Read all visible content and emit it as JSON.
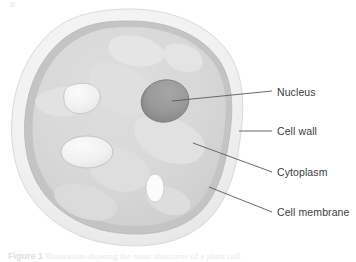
{
  "figure": {
    "caption_label": "Figure 1",
    "caption_text": "Illustration showing the main structures of a plant cell.",
    "background_color": "#ffffff"
  },
  "labels": [
    {
      "id": "nucleus",
      "text": "Nucleus"
    },
    {
      "id": "cell-wall",
      "text": "Cell wall"
    },
    {
      "id": "cytoplasm",
      "text": "Cytoplasm"
    },
    {
      "id": "cell-membrane",
      "text": "Cell membrane"
    }
  ],
  "colors": {
    "cell_wall": "#f1f1f1",
    "cell_wall_edge": "#dcdcdc",
    "cell_membrane": "#c6c6c6",
    "cytoplasm": "#d7d7d7",
    "cytoplasm_light": "#e4e4e4",
    "cytoplasm_lighter": "#ececec",
    "nucleus": "#9a9a9a",
    "nucleus_dark": "#8a8a8a",
    "nucleus_edge": "#7e7e7e",
    "vacuole": "#f0f0f0",
    "vacuole_edge": "#c4c4c4",
    "leader_line": "#5a5a5a",
    "label_text": "#3c3c3c"
  },
  "structures": [
    {
      "name": "cell-wall",
      "shape": "outer-ring"
    },
    {
      "name": "cell-membrane",
      "shape": "inner-ring"
    },
    {
      "name": "cytoplasm",
      "shape": "interior-fill"
    },
    {
      "name": "nucleus",
      "shape": "ellipse"
    },
    {
      "name": "vacuole-upper-left",
      "shape": "rounded-triangle"
    },
    {
      "name": "vacuole-mid-left",
      "shape": "ellipse"
    },
    {
      "name": "vacuole-lower-center",
      "shape": "small-ellipse"
    }
  ]
}
